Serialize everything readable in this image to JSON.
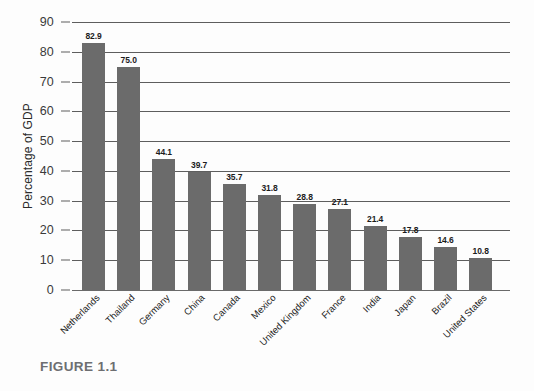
{
  "figure": {
    "caption": "FIGURE 1.1"
  },
  "chart_data": {
    "type": "bar",
    "title": "",
    "subtitle": "",
    "xlabel": "",
    "ylabel": "Percentage of GDP",
    "ylim": [
      0,
      90
    ],
    "ytick_step": 10,
    "yticks": [
      "0",
      "10",
      "20",
      "30",
      "40",
      "50",
      "60",
      "70",
      "80",
      "90"
    ],
    "grid": "horizontal",
    "legend": "none",
    "bar_color": "#6b6b6b",
    "categories": [
      "Netherlands",
      "Thailand",
      "Germany",
      "China",
      "Canada",
      "Mexico",
      "United Kingdom",
      "France",
      "India",
      "Japan",
      "Brazil",
      "United States"
    ],
    "values": [
      82.9,
      75.0,
      44.1,
      39.7,
      35.7,
      31.8,
      28.8,
      27.1,
      21.4,
      17.8,
      14.6,
      10.8
    ],
    "value_labels": [
      "82.9",
      "75.0",
      "44.1",
      "39.7",
      "35.7",
      "31.8",
      "28.8",
      "27.1",
      "21.4",
      "17.8",
      "14.6",
      "10.8"
    ]
  }
}
